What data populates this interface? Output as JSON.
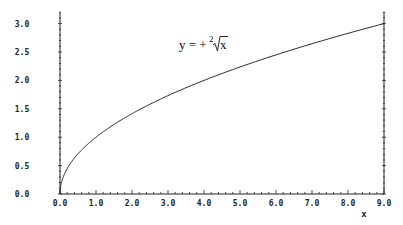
{
  "chart_data": {
    "type": "line",
    "title": "",
    "annotation": {
      "text": "y = +²√x",
      "prefix": "y = +",
      "root_index": "2",
      "radicand": "x"
    },
    "xlabel": "x",
    "ylabel": "",
    "xlim": [
      0,
      9
    ],
    "ylim": [
      0,
      3.2
    ],
    "x_ticks": [
      "0.0",
      "1.0",
      "2.0",
      "3.0",
      "4.0",
      "5.0",
      "6.0",
      "7.0",
      "8.0",
      "9.0"
    ],
    "y_ticks": [
      "0.0",
      "0.5",
      "1.0",
      "1.5",
      "2.0",
      "2.5",
      "3.0"
    ],
    "grid": false,
    "legend": null,
    "series": [
      {
        "name": "y = sqrt(x)",
        "x": [
          0,
          0.01,
          0.05,
          0.1,
          0.25,
          0.5,
          1,
          1.5,
          2,
          2.5,
          3,
          3.5,
          4,
          4.5,
          5,
          5.5,
          6,
          6.5,
          7,
          7.5,
          8,
          8.5,
          9
        ],
        "values": [
          0,
          0.1,
          0.224,
          0.316,
          0.5,
          0.707,
          1,
          1.225,
          1.414,
          1.581,
          1.732,
          1.871,
          2,
          2.121,
          2.236,
          2.345,
          2.449,
          2.55,
          2.646,
          2.739,
          2.828,
          2.915,
          3
        ],
        "color": "#222222"
      }
    ]
  }
}
